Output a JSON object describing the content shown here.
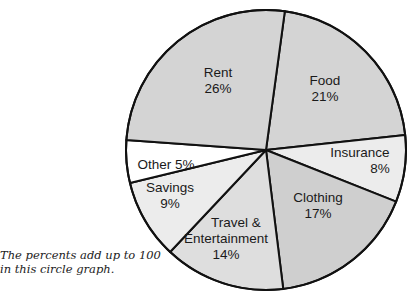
{
  "chart_data": {
    "type": "pie",
    "title": "",
    "caption": [
      "The percents add up to 100",
      "in this circle graph."
    ],
    "center": [
      266,
      150
    ],
    "radius": 140,
    "slices": [
      {
        "name": "Food",
        "value": 21,
        "label_lines": [
          "Food",
          "21%"
        ],
        "color": "#d4d4d4",
        "start": [
          285,
          10
        ],
        "end": [
          405,
          135
        ],
        "label_pos": [
          325,
          88
        ]
      },
      {
        "name": "Insurance",
        "value": 8,
        "label_lines": [
          "Insurance",
          "8%"
        ],
        "color": "#ececec",
        "start": [
          405,
          135
        ],
        "end": [
          397,
          202
        ],
        "label_pos": [
          360,
          160
        ]
      },
      {
        "name": "Clothing",
        "value": 17,
        "label_lines": [
          "Clothing",
          "17%"
        ],
        "color": "#cfcfcf",
        "start": [
          397,
          202
        ],
        "end": [
          283,
          287
        ],
        "label_pos": [
          318,
          205
        ]
      },
      {
        "name": "Travel & Entertainment",
        "value": 14,
        "label_lines": [
          "Travel &",
          "Entertainment",
          "14%"
        ],
        "color": "#dedede",
        "start": [
          283,
          287
        ],
        "end": [
          172,
          250
        ],
        "label_pos": [
          226,
          238
        ]
      },
      {
        "name": "Savings",
        "value": 9,
        "label_lines": [
          "Savings",
          "9%"
        ],
        "color": "#ececec",
        "start": [
          172,
          250
        ],
        "end": [
          130,
          183
        ],
        "label_pos": [
          170,
          195
        ]
      },
      {
        "name": "Other",
        "value": 5,
        "label_lines": [
          "Other 5%"
        ],
        "color": "#ffffff",
        "start": [
          130,
          183
        ],
        "end": [
          126,
          140
        ],
        "label_pos": [
          166,
          164
        ]
      },
      {
        "name": "Rent",
        "value": 26,
        "label_lines": [
          "Rent",
          "26%"
        ],
        "color": "#d4d4d4",
        "start": [
          126,
          140
        ],
        "end": [
          285,
          10
        ],
        "label_pos": [
          218,
          80
        ]
      }
    ],
    "categories": [
      "Rent",
      "Food",
      "Insurance",
      "Clothing",
      "Travel & Entertainment",
      "Savings",
      "Other"
    ],
    "values": [
      26,
      21,
      8,
      17,
      14,
      9,
      5
    ],
    "legend": "none (labels inside slices)"
  }
}
